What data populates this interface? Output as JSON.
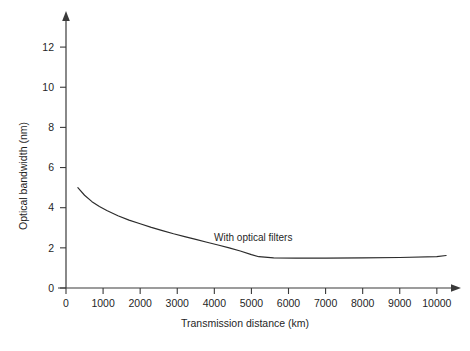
{
  "chart_data": {
    "type": "line",
    "title": "",
    "xlabel": "Transmission distance (km)",
    "ylabel": "Optical bandwidth (nm)",
    "xlim": [
      0,
      10800
    ],
    "ylim": [
      0,
      13.2
    ],
    "xticks": [
      0,
      1000,
      2000,
      3000,
      4000,
      5000,
      6000,
      7000,
      8000,
      9000,
      10000
    ],
    "xticklabels": [
      "0",
      "1000",
      "2000",
      "3000",
      "4000",
      "5000",
      "6000",
      "7000",
      "8000",
      "9000",
      "10000"
    ],
    "yticks": [
      0,
      2,
      4,
      6,
      8,
      10,
      12
    ],
    "yticklabels": [
      "0",
      "2",
      "4",
      "6",
      "8",
      "10",
      "12"
    ],
    "grid": false,
    "legend": false,
    "series": [
      {
        "name": "With optical filters",
        "x": [
          320,
          500,
          700,
          900,
          1100,
          1400,
          1700,
          2000,
          2300,
          2600,
          2900,
          3200,
          3500,
          3800,
          4100,
          4400,
          4700,
          5000,
          5200,
          5600,
          6200,
          7000,
          8000,
          9000,
          10000,
          10250
        ],
        "y": [
          5.0,
          4.62,
          4.3,
          4.06,
          3.86,
          3.6,
          3.38,
          3.2,
          3.02,
          2.86,
          2.7,
          2.56,
          2.42,
          2.28,
          2.14,
          2.0,
          1.84,
          1.66,
          1.56,
          1.5,
          1.49,
          1.49,
          1.5,
          1.52,
          1.56,
          1.62
        ]
      }
    ],
    "annotations": [
      {
        "text": "With optical filters",
        "x": 5050,
        "y": 2.35
      }
    ]
  },
  "axis": {
    "x_title": "Transmission distance (km)",
    "y_title": "Optical bandwidth (nm)"
  }
}
